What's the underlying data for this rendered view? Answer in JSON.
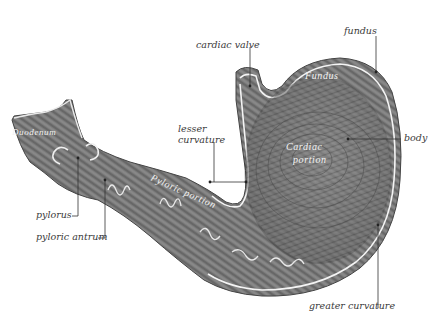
{
  "figure": {
    "colors": {
      "background": "#ffffff",
      "tissue_dark": "#5e5e5e",
      "tissue_mid": "#8a8a8a",
      "tissue_light": "#bdbdbd",
      "wall_highlight": "#f4f4f4",
      "label_text": "#3a3a3a",
      "inner_label_text": "#f2f2f2"
    }
  },
  "labels": {
    "cardiac_valve": "cardiac valve",
    "fundus": "fundus",
    "lesser_curvature_line1": "lesser",
    "lesser_curvature_line2": "curvature",
    "body": "body",
    "pylorus": "pylorus",
    "pyloric_antrum": "pyloric antrum",
    "greater_curvature": "greater curvature"
  },
  "inner_labels": {
    "fundus": "Fundus",
    "cardiac_line1": "Cardiac",
    "cardiac_line2": "portion",
    "pyloric": "Pyloric  portion",
    "duodenum": "Duodenum"
  }
}
